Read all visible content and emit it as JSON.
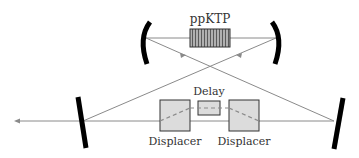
{
  "diagram": {
    "type": "optical-setup",
    "labels": {
      "crystal": "ppKTP",
      "delay": "Delay",
      "displacer_left": "Displacer",
      "displacer_right": "Displacer"
    },
    "components": [
      {
        "id": "curved-mirror-left",
        "kind": "curved-mirror"
      },
      {
        "id": "curved-mirror-right",
        "kind": "curved-mirror"
      },
      {
        "id": "ppktp-crystal",
        "kind": "nonlinear-crystal",
        "label": "ppKTP"
      },
      {
        "id": "flat-mirror-left",
        "kind": "flat-mirror"
      },
      {
        "id": "flat-mirror-right",
        "kind": "flat-mirror"
      },
      {
        "id": "displacer-left",
        "kind": "beam-displacer",
        "label": "Displacer"
      },
      {
        "id": "delay",
        "kind": "delay-element",
        "label": "Delay"
      },
      {
        "id": "displacer-right",
        "kind": "beam-displacer",
        "label": "Displacer"
      }
    ],
    "colors": {
      "beam": "#8a8a8a",
      "mirror": "#000000",
      "box_fill": "#dcdcdc",
      "box_stroke": "#333333",
      "crystal_fill": "#9a9a9a"
    }
  }
}
